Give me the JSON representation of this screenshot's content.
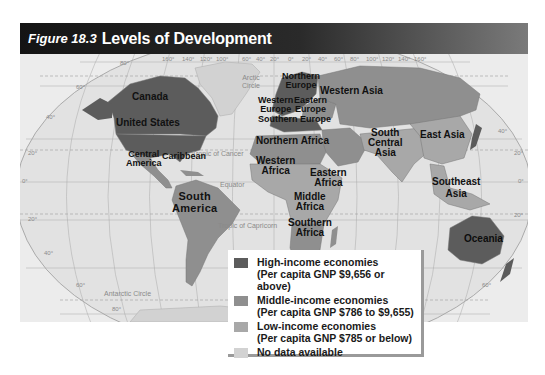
{
  "figure": {
    "number": "Figure 18.3",
    "title": "Levels of Development"
  },
  "colors": {
    "high_income": "#5c5c5c",
    "middle_income": "#8f8f8f",
    "low_income": "#a8a8a8",
    "no_data": "#d2d2d2",
    "ocean": "#e6e6e6"
  },
  "map": {
    "region_labels": [
      {
        "id": "canada",
        "text": "Canada",
        "category": "high_income"
      },
      {
        "id": "united-states",
        "text": "United States",
        "category": "high_income"
      },
      {
        "id": "central-america",
        "text": "Central America",
        "category": "middle_income"
      },
      {
        "id": "caribbean",
        "text": "Caribbean",
        "category": "middle_income"
      },
      {
        "id": "south-america",
        "text": "South America",
        "category": "middle_income"
      },
      {
        "id": "northern-europe",
        "text": "Northern Europe",
        "category": "high_income"
      },
      {
        "id": "western-europe",
        "text": "Western Europe",
        "category": "high_income"
      },
      {
        "id": "eastern-europe",
        "text": "Eastern Europe",
        "category": "middle_income"
      },
      {
        "id": "southern-europe",
        "text": "Southern Europe",
        "category": "high_income"
      },
      {
        "id": "western-asia",
        "text": "Western Asia",
        "category": "middle_income"
      },
      {
        "id": "northern-africa",
        "text": "Northern Africa",
        "category": "middle_income"
      },
      {
        "id": "western-africa",
        "text": "Western Africa",
        "category": "low_income"
      },
      {
        "id": "eastern-africa",
        "text": "Eastern Africa",
        "category": "low_income"
      },
      {
        "id": "middle-africa",
        "text": "Middle Africa",
        "category": "low_income"
      },
      {
        "id": "southern-africa",
        "text": "Southern Africa",
        "category": "middle_income"
      },
      {
        "id": "south-central-asia",
        "text": "South Central Asia",
        "category": "low_income"
      },
      {
        "id": "east-asia",
        "text": "East Asia",
        "category": "low_income"
      },
      {
        "id": "southeast-asia",
        "text": "Southeast Asia",
        "category": "low_income"
      },
      {
        "id": "oceania",
        "text": "Oceania",
        "category": "high_income"
      }
    ],
    "labels": {
      "canada": "Canada",
      "united_states": "United States",
      "central_america_1": "Central",
      "central_america_2": "America",
      "caribbean": "Caribbean",
      "south_america_1": "South",
      "south_america_2": "America",
      "northern_europe_1": "Northern",
      "northern_europe_2": "Europe",
      "western_europe_1": "Western",
      "western_europe_2": "Europe",
      "eastern_europe_1": "Eastern",
      "eastern_europe_2": "Europe",
      "southern_europe": "Southern Europe",
      "western_asia": "Western Asia",
      "northern_africa": "Northern Africa",
      "western_africa_1": "Western",
      "western_africa_2": "Africa",
      "eastern_africa_1": "Eastern",
      "eastern_africa_2": "Africa",
      "middle_africa_1": "Middle",
      "middle_africa_2": "Africa",
      "southern_africa_1": "Southern",
      "southern_africa_2": "Africa",
      "south_central_asia_1": "South",
      "south_central_asia_2": "Central",
      "south_central_asia_3": "Asia",
      "east_asia": "East Asia",
      "southeast_asia_1": "Southeast",
      "southeast_asia_2": "Asia",
      "oceania": "Oceania"
    },
    "reference_lines": {
      "arctic_circle_1": "Arctic",
      "arctic_circle_2": "Circle",
      "tropic_cancer": "Tropic of Cancer",
      "equator": "Equator",
      "tropic_capricorn": "Tropic of Capricorn",
      "antarctic_circle": "Antarctic Circle"
    },
    "longitude_ticks": [
      "160°",
      "140°",
      "120°",
      "100°",
      "60°",
      "40°",
      "20°",
      "0°",
      "20°",
      "40°",
      "60°",
      "80°",
      "100°",
      "120°",
      "140°",
      "160°"
    ],
    "latitude_ticks_left": [
      "80°",
      "60°",
      "40°",
      "20°",
      "0°",
      "20°",
      "40°",
      "60°",
      "80°"
    ],
    "latitude_ticks_right": [
      "40°",
      "20°",
      "0°",
      "20°",
      "60°"
    ]
  },
  "legend": {
    "items": [
      {
        "key": "high_income",
        "line1": "High-income economies",
        "line2": "(Per capita GNP $9,656 or above)"
      },
      {
        "key": "middle_income",
        "line1": "Middle-income economies",
        "line2": "(Per capita GNP $786 to $9,655)"
      },
      {
        "key": "low_income",
        "line1": "Low-income economies",
        "line2": "(Per capita GNP $785 or below)"
      },
      {
        "key": "no_data",
        "line1": "No data available",
        "line2": ""
      }
    ]
  }
}
